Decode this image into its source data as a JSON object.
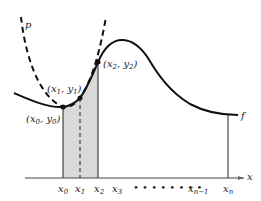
{
  "diagram": {
    "curve_f_label": "f",
    "curve_p_label": "p",
    "axis_label": "x",
    "points": [
      {
        "label": "(x0, y0)",
        "name": "x",
        "sub": "0",
        "name2": "y",
        "sub2": "0"
      },
      {
        "label": "(x1, y1)",
        "name": "x",
        "sub": "1",
        "name2": "y",
        "sub2": "1"
      },
      {
        "label": "(x2, y2)",
        "name": "x",
        "sub": "2",
        "name2": "y",
        "sub2": "2"
      }
    ],
    "ticks": [
      {
        "name": "x",
        "sub": "0"
      },
      {
        "name": "x",
        "sub": "1"
      },
      {
        "name": "x",
        "sub": "2"
      },
      {
        "name": "x",
        "sub": "3"
      },
      {
        "name": "x",
        "sub": "n−1"
      },
      {
        "name": "x",
        "sub": "n"
      }
    ],
    "dots": "• • • • • • • •",
    "colors": {
      "shade": "#d9d9d9",
      "line": "#111111"
    }
  }
}
